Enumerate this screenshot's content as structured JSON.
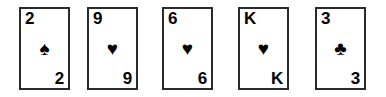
{
  "scene": {
    "title": "playing-card-hand",
    "background_color": "#ffffff",
    "card_border_color": "#2b2b2b",
    "card_face_color": "#ffffff",
    "pip_color": "#000000",
    "card_count": 5
  },
  "suit_glyphs": {
    "spade": "♠",
    "heart": "♥",
    "club": "♣",
    "diamond": "♦"
  },
  "cards": [
    {
      "rank": "2",
      "suit_name": "spade",
      "suit_glyph": "♠",
      "label": "2 of Spades",
      "color": "#000000"
    },
    {
      "rank": "9",
      "suit_name": "heart",
      "suit_glyph": "♥",
      "label": "9 of Hearts",
      "color": "#000000"
    },
    {
      "rank": "6",
      "suit_name": "heart",
      "suit_glyph": "♥",
      "label": "6 of Hearts",
      "color": "#000000"
    },
    {
      "rank": "K",
      "suit_name": "heart",
      "suit_glyph": "♥",
      "label": "King of Hearts",
      "color": "#000000"
    },
    {
      "rank": "3",
      "suit_name": "club",
      "suit_glyph": "♣",
      "label": "3 of Clubs",
      "color": "#000000"
    }
  ]
}
